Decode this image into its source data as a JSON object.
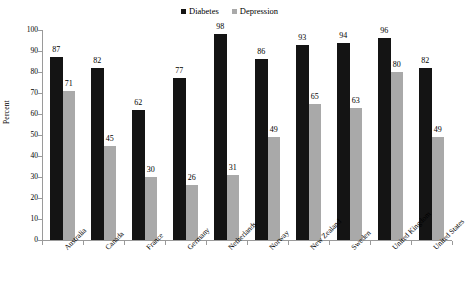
{
  "chart_data": {
    "type": "bar",
    "title": "",
    "subtitle": "",
    "xlabel": "",
    "ylabel": "Percent",
    "ylim": [
      0,
      100
    ],
    "ytick_step": 10,
    "yticks": [
      0,
      10,
      20,
      30,
      40,
      50,
      60,
      70,
      80,
      90,
      100
    ],
    "grid": false,
    "legend_position": "top-center",
    "value_labels": true,
    "categories": [
      "Australia",
      "Canada",
      "France",
      "Germany",
      "Netherlands",
      "Norway",
      "New Zealand",
      "Sweden",
      "United Kingdom",
      "United States"
    ],
    "series": [
      {
        "name": "Diabetes",
        "color": "#141414",
        "values": [
          87,
          82,
          62,
          77,
          98,
          86,
          93,
          94,
          96,
          82
        ]
      },
      {
        "name": "Depression",
        "color": "#a9a9a9",
        "values": [
          71,
          45,
          30,
          26,
          31,
          49,
          65,
          63,
          80,
          49
        ]
      }
    ]
  },
  "legend": {
    "items": [
      {
        "label": "Diabetes",
        "color": "#141414"
      },
      {
        "label": "Depression",
        "color": "#a9a9a9"
      }
    ]
  },
  "axes": {
    "y_title": "Percent"
  },
  "colors": {
    "axis": "#9a9a9a",
    "background": "#ffffff",
    "text": "#000000"
  }
}
